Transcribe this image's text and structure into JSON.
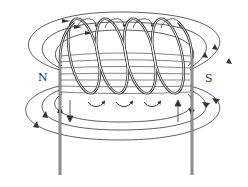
{
  "diagram": {
    "type": "solenoid-magnetic-field",
    "labels": {
      "north": "N",
      "south": "S"
    },
    "coil": {
      "turns": 4
    },
    "colors": {
      "line": "#333333",
      "background": "#ffffff"
    }
  }
}
